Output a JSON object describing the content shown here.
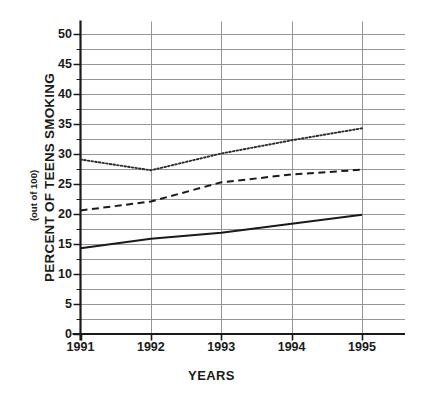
{
  "chart_data": {
    "type": "line",
    "title": "",
    "xlabel": "YEARS",
    "ylabel": "PERCENT OF TEENS SMOKING",
    "ylabel_sub": "(out of 100)",
    "categories": [
      "1991",
      "1992",
      "1993",
      "1994",
      "1995"
    ],
    "x": [
      1991,
      1992,
      1993,
      1994,
      1995
    ],
    "xlim": [
      1991,
      1995
    ],
    "ylim": [
      0,
      50
    ],
    "ytick_labels": [
      "0",
      "5",
      "10",
      "15",
      "20",
      "25",
      "30",
      "35",
      "40",
      "45",
      "50"
    ],
    "ytick_values": [
      0,
      5,
      10,
      15,
      20,
      25,
      30,
      35,
      40,
      45,
      50
    ],
    "minor_tick_step": 2.5,
    "grid": true,
    "grid_color": "#8a8a8a",
    "legend": "none",
    "axis_color": "#1a1a1a",
    "series": [
      {
        "name": "dotted-series",
        "style": "dotted",
        "color": "#2b2b2b",
        "values": [
          29.0,
          27.2,
          30.0,
          32.2,
          34.2
        ]
      },
      {
        "name": "dashed-series",
        "style": "dashed",
        "color": "#1a1a1a",
        "values": [
          20.5,
          22.0,
          25.2,
          26.5,
          27.3
        ]
      },
      {
        "name": "solid-series",
        "style": "solid",
        "color": "#1a1a1a",
        "values": [
          14.2,
          15.8,
          16.8,
          18.3,
          19.8
        ]
      }
    ]
  }
}
